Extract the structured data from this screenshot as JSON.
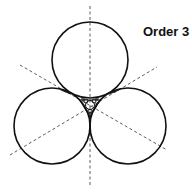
{
  "diagram": {
    "title": "Order 3",
    "stroke_color": "#111111",
    "background": "#ffffff"
  }
}
